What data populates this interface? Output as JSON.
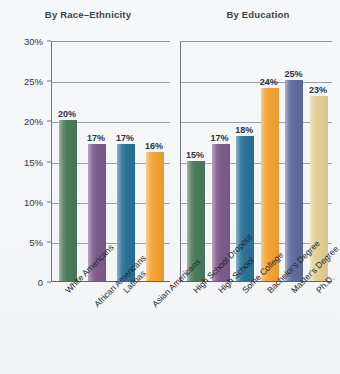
{
  "chart_data": {
    "type": "bar",
    "title": "",
    "ylabel": "",
    "xlabel": "",
    "ylim": [
      0,
      30
    ],
    "ytick_values": [
      0,
      5,
      10,
      15,
      20,
      25,
      30
    ],
    "ytick_labels": [
      "0",
      "5%",
      "10%",
      "15%",
      "20%",
      "25%",
      "30%"
    ],
    "grid": true,
    "legend": "none",
    "panels": [
      {
        "title": "By Race–Ethnicity",
        "categories": [
          "White Americans",
          "African Americans",
          "Latinas",
          "Asian Americans"
        ],
        "values": [
          20,
          17,
          17,
          16
        ],
        "value_labels": [
          "20%",
          "17%",
          "17%",
          "16%"
        ],
        "colors": [
          "#4a7a58",
          "#7d5a8c",
          "#2a7296",
          "#f3a131"
        ]
      },
      {
        "title": "By Education",
        "categories": [
          "High School Dropout",
          "High School",
          "Some College",
          "Bachelor's Degree",
          "Master's Degree",
          "Ph.D."
        ],
        "values": [
          15,
          17,
          18,
          24,
          25,
          23
        ],
        "value_labels": [
          "15%",
          "17%",
          "18%",
          "24%",
          "25%",
          "23%"
        ],
        "colors": [
          "#4a7a58",
          "#7d5a8c",
          "#2a7296",
          "#f3a131",
          "#5d6c9c",
          "#e2cd92"
        ]
      }
    ]
  }
}
